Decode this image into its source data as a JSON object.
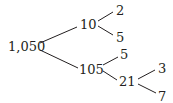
{
  "diagram": {
    "type": "factor-tree",
    "root": {
      "id": "n1050",
      "label": "1,050"
    },
    "nodes": [
      {
        "id": "n1050",
        "label": "1,050",
        "x": 8,
        "y": 40
      },
      {
        "id": "n10",
        "label": "10",
        "x": 80,
        "y": 18
      },
      {
        "id": "n2",
        "label": "2",
        "x": 116,
        "y": 4
      },
      {
        "id": "n5a",
        "label": "5",
        "x": 116,
        "y": 31
      },
      {
        "id": "n105",
        "label": "105",
        "x": 79,
        "y": 63
      },
      {
        "id": "n5b",
        "label": "5",
        "x": 120,
        "y": 48
      },
      {
        "id": "n21",
        "label": "21",
        "x": 119,
        "y": 75
      },
      {
        "id": "n3",
        "label": "3",
        "x": 158,
        "y": 62
      },
      {
        "id": "n7",
        "label": "7",
        "x": 158,
        "y": 90
      }
    ],
    "edges": [
      {
        "from": "n1050",
        "to": "n10",
        "x1": 40,
        "y1": 43,
        "x2": 77,
        "y2": 27
      },
      {
        "from": "n10",
        "to": "n2",
        "x1": 98,
        "y1": 21,
        "x2": 113,
        "y2": 12
      },
      {
        "from": "n10",
        "to": "n5a",
        "x1": 98,
        "y1": 26,
        "x2": 113,
        "y2": 35
      },
      {
        "from": "n1050",
        "to": "n105",
        "x1": 40,
        "y1": 50,
        "x2": 78,
        "y2": 68
      },
      {
        "from": "n105",
        "to": "n5b",
        "x1": 103,
        "y1": 65,
        "x2": 118,
        "y2": 57
      },
      {
        "from": "n105",
        "to": "n21",
        "x1": 103,
        "y1": 71,
        "x2": 117,
        "y2": 80
      },
      {
        "from": "n21",
        "to": "n3",
        "x1": 138,
        "y1": 79,
        "x2": 155,
        "y2": 70
      },
      {
        "from": "n21",
        "to": "n7",
        "x1": 138,
        "y1": 84,
        "x2": 156,
        "y2": 93
      }
    ],
    "line_color": "#231f20",
    "text_color": "#231f20",
    "background": "#ffffff"
  }
}
